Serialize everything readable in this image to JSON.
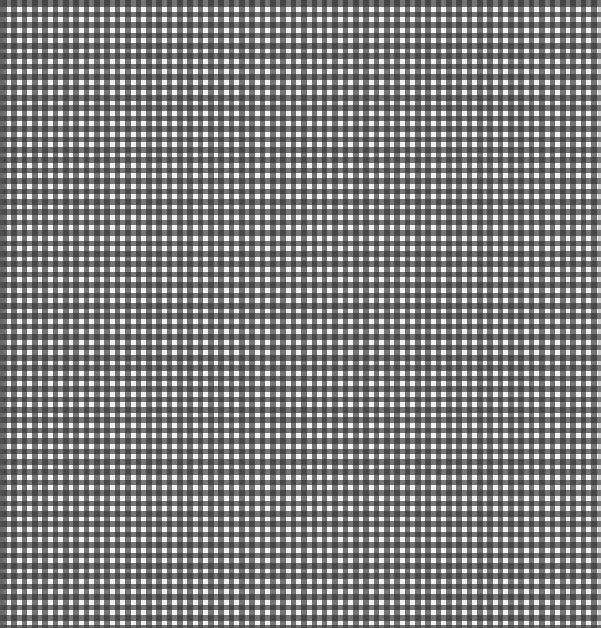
{
  "image": {
    "subject": "gingham check fabric texture",
    "pattern": "gingham",
    "colors": {
      "light_square": "#f2f2f2",
      "single_band": "#8a8a8a",
      "band_intersection": "#444444"
    },
    "pattern_period_px": {
      "horizontal": 10.35,
      "vertical": 10.4
    },
    "approx_repeats": {
      "columns": 58,
      "rows": 60
    }
  }
}
